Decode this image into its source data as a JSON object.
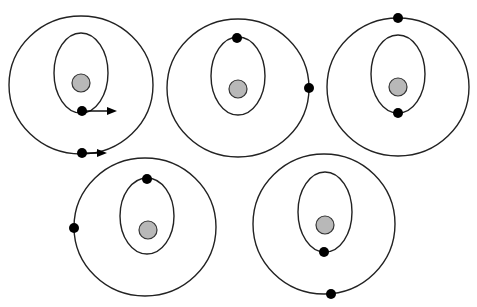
{
  "figure": {
    "colors": {
      "background": "#ffffff",
      "orbit_stroke": "#222222",
      "nucleus_fill": "#b8b8b8",
      "dot_fill": "#000000"
    },
    "panels": [
      {
        "id": "panel-1",
        "outer_orbit": {
          "cx": 81,
          "cy": 85,
          "rx": 72,
          "ry": 69
        },
        "inner_orbit": {
          "cx": 81,
          "cy": 73,
          "rx": 27,
          "ry": 40
        },
        "nucleus": {
          "cx": 81,
          "cy": 83,
          "r": 9
        },
        "dots": [
          {
            "cx": 82,
            "cy": 111,
            "r": 5,
            "orbit": "inner",
            "position": "bottom"
          },
          {
            "cx": 82,
            "cy": 153,
            "r": 5,
            "orbit": "outer",
            "position": "bottom"
          }
        ],
        "arrows": [
          {
            "x1": 82,
            "y1": 111,
            "x2": 117,
            "y2": 111,
            "label": "velocity-inner"
          },
          {
            "x1": 82,
            "y1": 153,
            "x2": 107,
            "y2": 153,
            "label": "velocity-outer"
          }
        ]
      },
      {
        "id": "panel-2",
        "outer_orbit": {
          "cx": 238,
          "cy": 88,
          "rx": 71,
          "ry": 69
        },
        "inner_orbit": {
          "cx": 238,
          "cy": 76,
          "rx": 27,
          "ry": 39
        },
        "nucleus": {
          "cx": 238,
          "cy": 89,
          "r": 9
        },
        "dots": [
          {
            "cx": 237,
            "cy": 38,
            "r": 5,
            "orbit": "inner",
            "position": "top"
          },
          {
            "cx": 309,
            "cy": 88,
            "r": 5,
            "orbit": "outer",
            "position": "right"
          }
        ],
        "arrows": []
      },
      {
        "id": "panel-3",
        "outer_orbit": {
          "cx": 398,
          "cy": 87,
          "rx": 71,
          "ry": 69
        },
        "inner_orbit": {
          "cx": 398,
          "cy": 74,
          "rx": 27,
          "ry": 39
        },
        "nucleus": {
          "cx": 398,
          "cy": 87,
          "r": 9
        },
        "dots": [
          {
            "cx": 398,
            "cy": 113,
            "r": 5,
            "orbit": "inner",
            "position": "bottom"
          },
          {
            "cx": 398,
            "cy": 18,
            "r": 5,
            "orbit": "outer",
            "position": "top"
          }
        ],
        "arrows": []
      },
      {
        "id": "panel-4",
        "outer_orbit": {
          "cx": 145,
          "cy": 227,
          "rx": 71,
          "ry": 69
        },
        "inner_orbit": {
          "cx": 147,
          "cy": 216,
          "rx": 27,
          "ry": 38
        },
        "nucleus": {
          "cx": 148,
          "cy": 230,
          "r": 9
        },
        "dots": [
          {
            "cx": 147,
            "cy": 179,
            "r": 5,
            "orbit": "inner",
            "position": "top"
          },
          {
            "cx": 74,
            "cy": 228,
            "r": 5,
            "orbit": "outer",
            "position": "left"
          }
        ],
        "arrows": []
      },
      {
        "id": "panel-5",
        "outer_orbit": {
          "cx": 324,
          "cy": 224,
          "rx": 71,
          "ry": 70
        },
        "inner_orbit": {
          "cx": 325,
          "cy": 212,
          "rx": 27,
          "ry": 40
        },
        "nucleus": {
          "cx": 325,
          "cy": 225,
          "r": 9
        },
        "dots": [
          {
            "cx": 324,
            "cy": 252,
            "r": 5,
            "orbit": "inner",
            "position": "bottom"
          },
          {
            "cx": 331,
            "cy": 294,
            "r": 5,
            "orbit": "outer",
            "position": "bottom"
          }
        ],
        "arrows": []
      }
    ]
  }
}
